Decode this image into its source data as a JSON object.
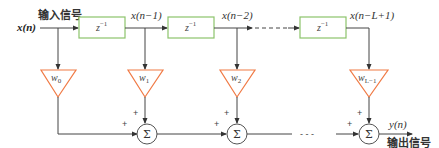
{
  "diagram": {
    "type": "FIR transversal filter (tapped delay line)",
    "input": {
      "symbol": "x(n)",
      "label": "输入信号"
    },
    "output": {
      "symbol": "y(n)",
      "label": "输出信号"
    },
    "delay_blocks": [
      {
        "label": "z",
        "exp": "−1"
      },
      {
        "label": "z",
        "exp": "−1"
      },
      {
        "label": "z",
        "exp": "−1"
      }
    ],
    "taps": [
      {
        "signal": "x(n)",
        "weight": "w",
        "sub": "0"
      },
      {
        "signal": "x(n−1)",
        "weight": "w",
        "sub": "1"
      },
      {
        "signal": "x(n−2)",
        "weight": "w",
        "sub": "2"
      },
      {
        "signal": "x(n−L+1)",
        "weight": "w",
        "sub": "L−1"
      }
    ],
    "summer": {
      "symbol": "Σ",
      "input_sign": "+"
    },
    "ellipsis": "- - -",
    "colors": {
      "delay_box_stroke": "#8cc36b",
      "weight_triangle_stroke": "#f07a45",
      "line": "#444444",
      "summer_stroke": "#555555"
    }
  }
}
